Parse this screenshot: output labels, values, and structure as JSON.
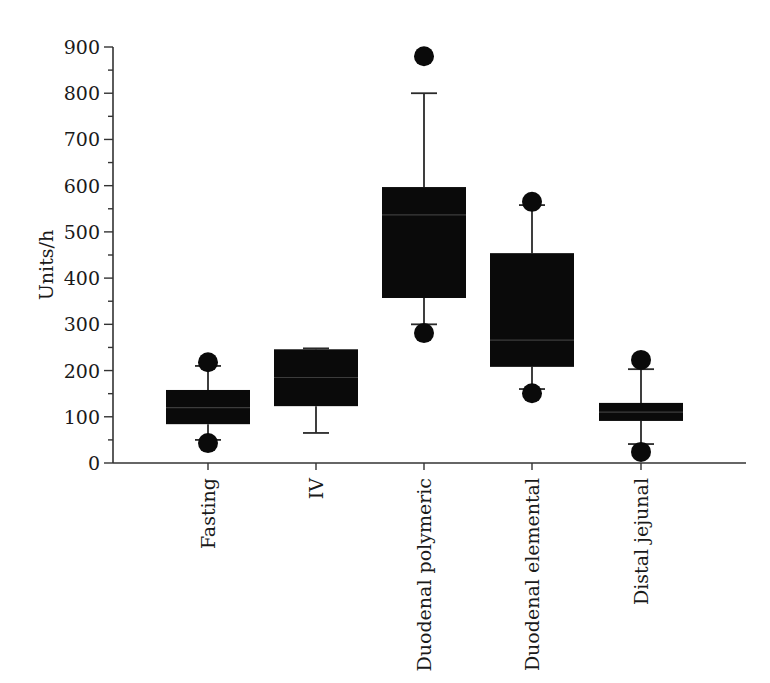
{
  "chart_data": {
    "type": "box",
    "title": "",
    "xlabel": "",
    "ylabel": "Units/h",
    "ylim": [
      0,
      900
    ],
    "yticks": [
      0,
      100,
      200,
      300,
      400,
      500,
      600,
      700,
      800,
      900
    ],
    "yminor_step": 50,
    "grid": false,
    "legend": null,
    "categories": [
      "Fasting",
      "IV",
      "Duodenal polymeric",
      "Duodenal elemental",
      "Distal jejunal"
    ],
    "series": [
      {
        "name": "Fasting",
        "whisker_low": 50,
        "q1": 84,
        "median": 120,
        "q3": 158,
        "whisker_high": 210,
        "outliers": [
          43,
          218
        ]
      },
      {
        "name": "IV",
        "whisker_low": 65,
        "q1": 123,
        "median": 185,
        "q3": 246,
        "whisker_high": 248,
        "outliers": []
      },
      {
        "name": "Duodenal polymeric",
        "whisker_low": 300,
        "q1": 357,
        "median": 537,
        "q3": 597,
        "whisker_high": 800,
        "outliers": [
          281,
          880
        ]
      },
      {
        "name": "Duodenal elemental",
        "whisker_low": 160,
        "q1": 208,
        "median": 266,
        "q3": 454,
        "whisker_high": 558,
        "outliers": [
          151,
          565
        ]
      },
      {
        "name": "Distal jejunal",
        "whisker_low": 41,
        "q1": 91,
        "median": 110,
        "q3": 130,
        "whisker_high": 203,
        "outliers": [
          24,
          223
        ]
      }
    ],
    "colors": {
      "box": "#0a0a0a",
      "axis": "#333333",
      "background": "#ffffff"
    }
  },
  "layout": {
    "plot": {
      "x0": 113,
      "x1": 746,
      "y0": 463,
      "y900": 47
    },
    "category_centers": [
      208,
      316,
      424,
      532,
      641
    ],
    "box_half_width": 42,
    "cap_half_width": 13,
    "outlier_radius": 10
  }
}
